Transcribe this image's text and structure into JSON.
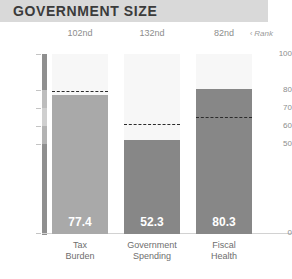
{
  "header": {
    "title": "GOVERNMENT SIZE",
    "band_color": "#d9d9d9",
    "title_color": "#3b3b3b"
  },
  "rank_row": {
    "note_label": "Rank",
    "note_marker": "‹",
    "ranks": [
      "102nd",
      "132nd",
      "82nd"
    ]
  },
  "chart_data": {
    "type": "bar",
    "title": "GOVERNMENT SIZE",
    "subtitle": "",
    "xlabel": "",
    "ylabel": "",
    "ylim": [
      0,
      100
    ],
    "grid": false,
    "legend": "none",
    "yticks": [
      0,
      50,
      60,
      70,
      80,
      100
    ],
    "ytick_labels": [
      "0",
      "50",
      "60",
      "70",
      "80",
      "100"
    ],
    "categories": [
      "Tax\nBurden",
      "Government\nSpending",
      "Fiscal\nHealth"
    ],
    "categories_flat": [
      "Tax Burden",
      "Government Spending",
      "Fiscal Health"
    ],
    "values": [
      77.4,
      52.3,
      80.3
    ],
    "value_labels": [
      "77.4",
      "52.3",
      "80.3"
    ],
    "ranks": [
      "102nd",
      "132nd",
      "82nd"
    ],
    "benchmarks": [
      79.5,
      61.0,
      65.0
    ],
    "bar_colors": [
      "#a9a9a9",
      "#878787",
      "#878787"
    ],
    "benchmark_style": "dashed",
    "benchmark_color": "#2b2b2b",
    "column_background": "#f7f7f7",
    "axis_color": "#9b9b9b",
    "tick_label_color": "#8d8d8d",
    "annotation": "Rank"
  }
}
